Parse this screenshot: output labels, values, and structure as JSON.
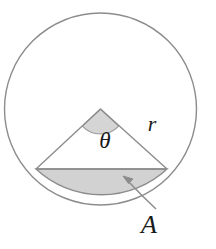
{
  "figure": {
    "type": "geometric-diagram",
    "background_color": "#ffffff",
    "stroke_color": "#8c8c8c",
    "shade_color": "#d2d2d2",
    "label_color": "#1a1a1a",
    "labels": {
      "theta": "θ",
      "radius": "r",
      "area": "A"
    },
    "geometry": {
      "circle": {
        "cx": 100.5,
        "cy": 109,
        "r": 96
      },
      "apex": {
        "x": 100.5,
        "y": 109
      },
      "chord_left": {
        "x": 36,
        "y": 169
      },
      "chord_right": {
        "x": 167,
        "y": 169
      },
      "angle_arc_radius": 22,
      "arrow_tip": {
        "x": 124,
        "y": 178
      },
      "arrow_tail": {
        "x": 156,
        "y": 209
      }
    },
    "label_positions": {
      "theta": {
        "x": 105,
        "y": 148
      },
      "radius": {
        "x": 152,
        "y": 131
      },
      "area": {
        "x": 141,
        "y": 233
      }
    }
  }
}
